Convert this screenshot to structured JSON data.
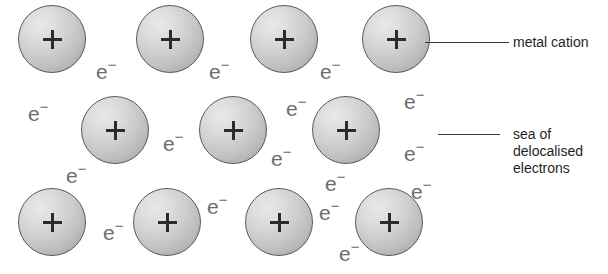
{
  "diagram": {
    "colors": {
      "background": "#ffffff",
      "cation_fill_light": "#e8e8e8",
      "cation_fill_dark": "#a2a2a2",
      "cation_outline": "#595959",
      "plus_sign": "#2b2b2b",
      "electron_text": "#6d6d6d",
      "label_text": "#1f1f1f",
      "leader_line": "#3a3a3a"
    },
    "cations": [
      {
        "id": "cation-r1-c1",
        "label": "+",
        "x": 18,
        "y": 5,
        "d": 68
      },
      {
        "id": "cation-r1-c2",
        "label": "+",
        "x": 136,
        "y": 5,
        "d": 68
      },
      {
        "id": "cation-r1-c3",
        "label": "+",
        "x": 250,
        "y": 5,
        "d": 68
      },
      {
        "id": "cation-r1-c4",
        "label": "+",
        "x": 362,
        "y": 5,
        "d": 68
      },
      {
        "id": "cation-r2-c1",
        "label": "+",
        "x": 81,
        "y": 96,
        "d": 68
      },
      {
        "id": "cation-r2-c2",
        "label": "+",
        "x": 199,
        "y": 96,
        "d": 68
      },
      {
        "id": "cation-r2-c3",
        "label": "+",
        "x": 312,
        "y": 96,
        "d": 68
      },
      {
        "id": "cation-r3-c1",
        "label": "+",
        "x": 18,
        "y": 188,
        "d": 68
      },
      {
        "id": "cation-r3-c2",
        "label": "+",
        "x": 133,
        "y": 188,
        "d": 68
      },
      {
        "id": "cation-r3-c3",
        "label": "+",
        "x": 245,
        "y": 188,
        "d": 68
      },
      {
        "id": "cation-r3-c4",
        "label": "+",
        "x": 355,
        "y": 188,
        "d": 68
      }
    ],
    "electron_symbol": "e",
    "electron_charge": "−",
    "electrons": [
      {
        "id": "electron-1",
        "x": 96,
        "y": 61
      },
      {
        "id": "electron-2",
        "x": 209,
        "y": 61
      },
      {
        "id": "electron-3",
        "x": 320,
        "y": 61
      },
      {
        "id": "electron-4",
        "x": 28,
        "y": 103
      },
      {
        "id": "electron-5",
        "x": 404,
        "y": 91
      },
      {
        "id": "electron-6",
        "x": 286,
        "y": 98
      },
      {
        "id": "electron-7",
        "x": 163,
        "y": 133
      },
      {
        "id": "electron-8",
        "x": 271,
        "y": 148
      },
      {
        "id": "electron-9",
        "x": 404,
        "y": 143
      },
      {
        "id": "electron-10",
        "x": 66,
        "y": 165
      },
      {
        "id": "electron-11",
        "x": 325,
        "y": 173
      },
      {
        "id": "electron-12",
        "x": 103,
        "y": 222
      },
      {
        "id": "electron-13",
        "x": 207,
        "y": 196
      },
      {
        "id": "electron-14",
        "x": 319,
        "y": 202
      },
      {
        "id": "electron-15",
        "x": 411,
        "y": 181
      },
      {
        "id": "electron-16",
        "x": 339,
        "y": 243
      }
    ],
    "callouts": [
      {
        "id": "callout-metal-cation",
        "text": "metal cation",
        "text_x": 513,
        "text_y": 34,
        "line_x": 425,
        "line_y": 42,
        "line_w": 84
      },
      {
        "id": "callout-electron-sea",
        "text": "sea of\ndelocalised\nelectrons",
        "text_x": 513,
        "text_y": 126,
        "line_x": 438,
        "line_y": 134,
        "line_w": 62
      }
    ]
  }
}
